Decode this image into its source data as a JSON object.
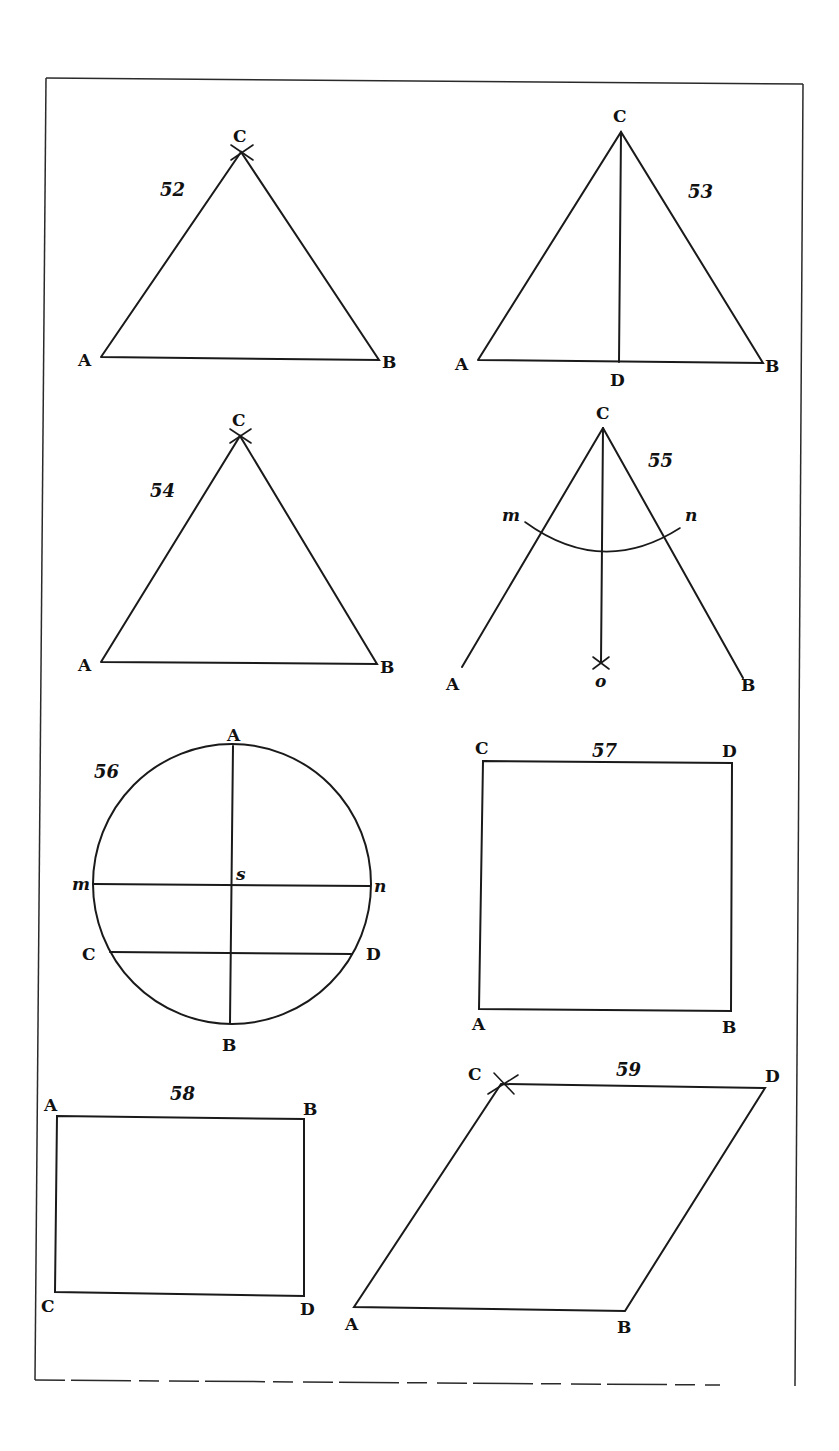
{
  "plate": {
    "figures": [
      {
        "number": "52",
        "type": "equilateral triangle",
        "labels": {
          "A": "A",
          "B": "B",
          "C": "C"
        }
      },
      {
        "number": "53",
        "type": "triangle with altitude",
        "labels": {
          "A": "A",
          "B": "B",
          "C": "C",
          "D": "D"
        }
      },
      {
        "number": "54",
        "type": "equilateral triangle",
        "labels": {
          "A": "A",
          "B": "B",
          "C": "C"
        }
      },
      {
        "number": "55",
        "type": "angle bisection",
        "labels": {
          "A": "A",
          "B": "B",
          "C": "C",
          "m": "m",
          "n": "n",
          "o": "o"
        }
      },
      {
        "number": "56",
        "type": "circle with diameters",
        "labels": {
          "A": "A",
          "B": "B",
          "C": "C",
          "D": "D",
          "m": "m",
          "n": "n",
          "s": "s"
        }
      },
      {
        "number": "57",
        "type": "square",
        "labels": {
          "A": "A",
          "B": "B",
          "C": "C",
          "D": "D"
        }
      },
      {
        "number": "58",
        "type": "rectangle",
        "labels": {
          "A": "A",
          "B": "B",
          "C": "C",
          "D": "D"
        }
      },
      {
        "number": "59",
        "type": "rhombus",
        "labels": {
          "A": "A",
          "B": "B",
          "C": "C",
          "D": "D"
        }
      }
    ]
  }
}
